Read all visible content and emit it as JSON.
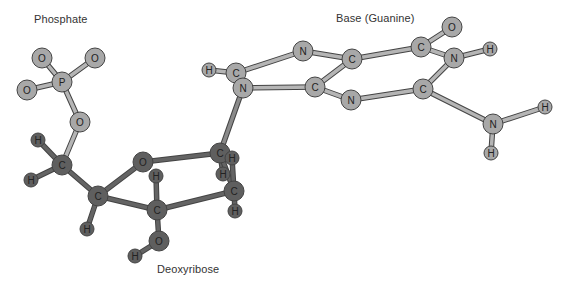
{
  "labels": {
    "phosphate": "Phosphate",
    "base": "Base (Guanine)",
    "sugar": "Deoxyribose"
  },
  "colors": {
    "light_atom": "#a8a8a8",
    "dark_atom": "#5f5f5f",
    "light_bond": "#b5b5b5",
    "dark_bond": "#646464",
    "outline": "#444444"
  },
  "atoms": [
    {
      "id": "pO1",
      "el": "O",
      "x": 42,
      "y": 58,
      "tone": "light"
    },
    {
      "id": "pO2",
      "el": "O",
      "x": 95,
      "y": 58,
      "tone": "light"
    },
    {
      "id": "P",
      "el": "P",
      "x": 62,
      "y": 82,
      "tone": "light"
    },
    {
      "id": "pO3",
      "el": "O",
      "x": 27,
      "y": 90,
      "tone": "light"
    },
    {
      "id": "pO4",
      "el": "O",
      "x": 80,
      "y": 122,
      "tone": "light"
    },
    {
      "id": "H5a",
      "el": "H",
      "x": 38,
      "y": 140,
      "tone": "dark"
    },
    {
      "id": "C5",
      "el": "C",
      "x": 62,
      "y": 165,
      "tone": "dark"
    },
    {
      "id": "H5b",
      "el": "H",
      "x": 31,
      "y": 180,
      "tone": "dark"
    },
    {
      "id": "C4",
      "el": "C",
      "x": 98,
      "y": 196,
      "tone": "dark"
    },
    {
      "id": "H4",
      "el": "H",
      "x": 87,
      "y": 229,
      "tone": "dark"
    },
    {
      "id": "O4r",
      "el": "O",
      "x": 143,
      "y": 162,
      "tone": "dark"
    },
    {
      "id": "C1",
      "el": "C",
      "x": 220,
      "y": 153,
      "tone": "dark"
    },
    {
      "id": "H1",
      "el": "H",
      "x": 232,
      "y": 158,
      "tone": "dark"
    },
    {
      "id": "H2a",
      "el": "H",
      "x": 223,
      "y": 174,
      "tone": "dark"
    },
    {
      "id": "C2",
      "el": "C",
      "x": 234,
      "y": 191,
      "tone": "dark"
    },
    {
      "id": "H2b",
      "el": "H",
      "x": 235,
      "y": 211,
      "tone": "dark"
    },
    {
      "id": "C3",
      "el": "C",
      "x": 157,
      "y": 210,
      "tone": "dark"
    },
    {
      "id": "H3",
      "el": "H",
      "x": 156,
      "y": 176,
      "tone": "dark"
    },
    {
      "id": "O3",
      "el": "O",
      "x": 159,
      "y": 241,
      "tone": "dark"
    },
    {
      "id": "HO3",
      "el": "H",
      "x": 135,
      "y": 256,
      "tone": "dark"
    },
    {
      "id": "gH8",
      "el": "H",
      "x": 209,
      "y": 70,
      "tone": "light"
    },
    {
      "id": "gC8",
      "el": "C",
      "x": 236,
      "y": 73,
      "tone": "light"
    },
    {
      "id": "gN9",
      "el": "N",
      "x": 243,
      "y": 88,
      "tone": "light"
    },
    {
      "id": "gN7",
      "el": "N",
      "x": 303,
      "y": 51,
      "tone": "light"
    },
    {
      "id": "gC5",
      "el": "C",
      "x": 352,
      "y": 59,
      "tone": "light"
    },
    {
      "id": "gC4",
      "el": "C",
      "x": 315,
      "y": 87,
      "tone": "light"
    },
    {
      "id": "gN3",
      "el": "N",
      "x": 351,
      "y": 100,
      "tone": "light"
    },
    {
      "id": "gC6",
      "el": "C",
      "x": 421,
      "y": 47,
      "tone": "light"
    },
    {
      "id": "gO6",
      "el": "O",
      "x": 452,
      "y": 27,
      "tone": "light"
    },
    {
      "id": "gN1",
      "el": "N",
      "x": 454,
      "y": 58,
      "tone": "light"
    },
    {
      "id": "gH1",
      "el": "H",
      "x": 490,
      "y": 49,
      "tone": "light"
    },
    {
      "id": "gC2",
      "el": "C",
      "x": 423,
      "y": 89,
      "tone": "light"
    },
    {
      "id": "gN2",
      "el": "N",
      "x": 493,
      "y": 124,
      "tone": "light"
    },
    {
      "id": "gH2a",
      "el": "H",
      "x": 545,
      "y": 107,
      "tone": "light"
    },
    {
      "id": "gH2b",
      "el": "H",
      "x": 491,
      "y": 153,
      "tone": "light"
    }
  ],
  "bonds": [
    [
      "pO1",
      "P",
      "light"
    ],
    [
      "pO2",
      "P",
      "light"
    ],
    [
      "pO3",
      "P",
      "light"
    ],
    [
      "P",
      "pO4",
      "light"
    ],
    [
      "pO4",
      "C5",
      "light"
    ],
    [
      "H5a",
      "C5",
      "dark"
    ],
    [
      "H5b",
      "C5",
      "dark"
    ],
    [
      "C5",
      "C4",
      "dark"
    ],
    [
      "C4",
      "H4",
      "dark"
    ],
    [
      "C4",
      "O4r",
      "dark"
    ],
    [
      "C4",
      "C3",
      "dark"
    ],
    [
      "O4r",
      "C1",
      "dark"
    ],
    [
      "C1",
      "H1",
      "dark"
    ],
    [
      "C1",
      "H2a",
      "dark"
    ],
    [
      "C1",
      "C2",
      "dark"
    ],
    [
      "H1",
      "C2",
      "dark"
    ],
    [
      "C2",
      "H2b",
      "dark"
    ],
    [
      "C3",
      "C2",
      "dark"
    ],
    [
      "C3",
      "H3",
      "dark"
    ],
    [
      "C3",
      "O3",
      "dark"
    ],
    [
      "O3",
      "HO3",
      "dark"
    ],
    [
      "C1",
      "gN9",
      "mid"
    ],
    [
      "gH8",
      "gC8",
      "light"
    ],
    [
      "gC8",
      "gN9",
      "light"
    ],
    [
      "gC8",
      "gN7",
      "light"
    ],
    [
      "gN7",
      "gC5",
      "light"
    ],
    [
      "gN9",
      "gC4",
      "light"
    ],
    [
      "gC4",
      "gC5",
      "light"
    ],
    [
      "gC4",
      "gN3",
      "light"
    ],
    [
      "gN3",
      "gC2",
      "light"
    ],
    [
      "gC5",
      "gC6",
      "light"
    ],
    [
      "gC6",
      "gO6",
      "light"
    ],
    [
      "gC6",
      "gN1",
      "light"
    ],
    [
      "gN1",
      "gH1",
      "light"
    ],
    [
      "gN1",
      "gC2",
      "light"
    ],
    [
      "gC2",
      "gN2",
      "light"
    ],
    [
      "gN2",
      "gH2a",
      "light"
    ],
    [
      "gN2",
      "gH2b",
      "light"
    ]
  ]
}
